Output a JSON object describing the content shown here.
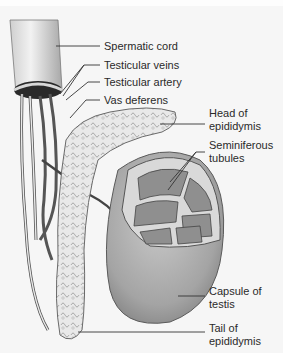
{
  "diagram": {
    "labels": [
      {
        "id": "spermatic-cord",
        "lines": [
          "Spermatic cord"
        ]
      },
      {
        "id": "testicular-veins",
        "lines": [
          "Testicular veins"
        ]
      },
      {
        "id": "testicular-artery",
        "lines": [
          "Testicular artery"
        ]
      },
      {
        "id": "vas-deferens",
        "lines": [
          "Vas deferens"
        ]
      },
      {
        "id": "head-of-epididymis",
        "lines": [
          "Head of",
          "epididymis"
        ]
      },
      {
        "id": "seminiferous-tubules",
        "lines": [
          "Seminiferous",
          "tubules"
        ]
      },
      {
        "id": "capsule-of-testis",
        "lines": [
          "Capsule of",
          "testis"
        ]
      },
      {
        "id": "tail-of-epididymis",
        "lines": [
          "Tail of",
          "epididymis"
        ]
      }
    ]
  },
  "colors": {
    "background": "#f6f6f6",
    "line": "#333333",
    "text": "#2a2a2a"
  }
}
